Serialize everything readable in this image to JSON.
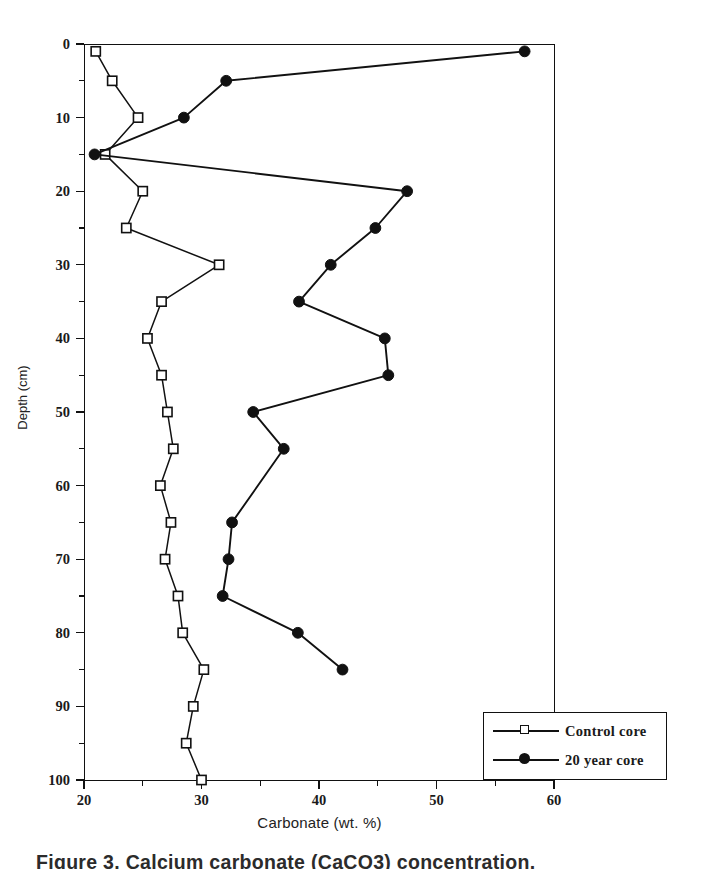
{
  "chart_data": {
    "type": "line",
    "title": "",
    "xlabel": "Carbonate  (wt. %)",
    "ylabel": "Depth (cm)",
    "xlim": [
      20,
      60
    ],
    "ylim": [
      0,
      100
    ],
    "y_inverted": true,
    "grid": false,
    "legend_position": "bottom-right",
    "x_ticks": [
      20,
      30,
      40,
      50,
      60
    ],
    "x_tick_labels": [
      "20",
      "30",
      "40",
      "50",
      "60"
    ],
    "x_minor_ticks": [
      25,
      35,
      45,
      55
    ],
    "y_ticks": [
      0,
      10,
      20,
      30,
      40,
      50,
      60,
      70,
      80,
      90,
      100
    ],
    "y_tick_labels": [
      "0",
      "10",
      "20",
      "30",
      "40",
      "50",
      "60",
      "70",
      "80",
      "90",
      "100"
    ],
    "y_minor_ticks": [
      5,
      15,
      25,
      35,
      45,
      55,
      65,
      75,
      85,
      95
    ],
    "series": [
      {
        "name": "Control core",
        "marker": "open-square",
        "color": "#111111",
        "depth": [
          1,
          5,
          10,
          15,
          20,
          25,
          30,
          35,
          40,
          45,
          50,
          55,
          60,
          65,
          70,
          75,
          80,
          85,
          90,
          95,
          100
        ],
        "values": [
          21.0,
          22.4,
          24.6,
          21.8,
          25.0,
          23.6,
          31.5,
          26.6,
          25.4,
          26.6,
          27.1,
          27.6,
          26.5,
          27.4,
          26.9,
          28.0,
          28.4,
          30.2,
          29.3,
          28.7,
          30.0
        ]
      },
      {
        "name": "20 year core",
        "marker": "filled-circle",
        "color": "#111111",
        "depth": [
          1,
          5,
          10,
          15,
          20,
          25,
          30,
          35,
          40,
          45,
          50,
          55,
          65,
          70,
          75,
          80,
          85
        ],
        "values": [
          57.5,
          32.1,
          28.5,
          20.9,
          47.5,
          44.8,
          41.0,
          38.3,
          45.6,
          45.9,
          34.4,
          37.0,
          32.6,
          32.3,
          31.8,
          38.2,
          42.0
        ]
      }
    ]
  },
  "legend": {
    "entries": [
      {
        "label": "Control core"
      },
      {
        "label": "20 year core"
      }
    ]
  },
  "caption": {
    "text": "Figure 3.  Calcium carbonate (CaCO3) concentration."
  }
}
